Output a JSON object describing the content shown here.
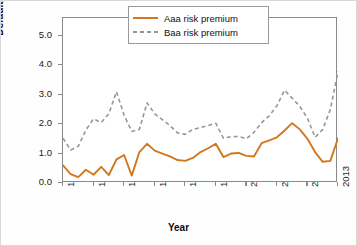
{
  "chart_data": {
    "type": "line",
    "title": "",
    "xlabel": "Year",
    "ylabel": "Default Premium (%)",
    "xlim": [
      1977,
      2013
    ],
    "ylim": [
      0.0,
      5.6
    ],
    "grid": false,
    "legend_position": "top-right-inside",
    "xticks": [
      "1977",
      "1981",
      "1985",
      "1989",
      "1993",
      "1997",
      "2001",
      "2005",
      "2009",
      "2013"
    ],
    "xtick_values": [
      1977,
      1981,
      1985,
      1989,
      1993,
      1997,
      2001,
      2005,
      2009,
      2013
    ],
    "yticks": [
      "0.0",
      "1.0",
      "2.0",
      "3.0",
      "4.0",
      "5.0"
    ],
    "ytick_values": [
      0.0,
      1.0,
      2.0,
      3.0,
      4.0,
      5.0
    ],
    "x": [
      1977,
      1978,
      1979,
      1980,
      1981,
      1982,
      1983,
      1984,
      1985,
      1986,
      1987,
      1988,
      1989,
      1990,
      1991,
      1992,
      1993,
      1994,
      1995,
      1996,
      1997,
      1998,
      1999,
      2000,
      2001,
      2002,
      2003,
      2004,
      2005,
      2006,
      2007,
      2008,
      2009,
      2010,
      2011,
      2012,
      2013
    ],
    "series": [
      {
        "name": "Aaa risk premium",
        "style": "solid",
        "color": "#D2771F",
        "values": [
          0.6,
          0.3,
          0.2,
          0.45,
          0.28,
          0.55,
          0.27,
          0.8,
          0.95,
          0.25,
          1.05,
          1.33,
          1.1,
          1.0,
          0.9,
          0.78,
          0.75,
          0.85,
          1.05,
          1.18,
          1.33,
          0.88,
          1.0,
          1.02,
          0.92,
          0.9,
          1.35,
          1.45,
          1.55,
          1.78,
          2.03,
          1.82,
          1.5,
          1.05,
          0.72,
          0.75,
          1.52
        ]
      },
      {
        "name": "Baa risk premium",
        "style": "dashed",
        "color": "#8C9C94",
        "values": [
          1.52,
          1.12,
          1.25,
          1.8,
          2.18,
          2.05,
          2.35,
          3.1,
          2.3,
          1.75,
          1.82,
          2.72,
          2.35,
          2.15,
          1.95,
          1.7,
          1.65,
          1.82,
          1.88,
          1.95,
          2.03,
          1.52,
          1.57,
          1.58,
          1.5,
          1.72,
          2.05,
          2.28,
          2.62,
          3.15,
          2.88,
          2.6,
          2.2,
          1.55,
          1.82,
          2.5,
          3.78
        ]
      }
    ],
    "series_extended": {
      "note": "values continue through 2013",
      "aaa_tail": [
        1.95,
        2.0,
        1.65,
        1.72,
        1.8,
        1.88
      ],
      "baa_tail": [
        4.0,
        3.3,
        2.72,
        2.78,
        3.05,
        2.8
      ]
    }
  },
  "axis": {
    "y_title": "Default Premium (%)",
    "x_title": "Year"
  },
  "legend": {
    "items": [
      {
        "label": "Aaa risk premium",
        "style": "solid",
        "color": "#D2771F"
      },
      {
        "label": "Baa risk premium",
        "style": "dashed",
        "color": "#8C9C94"
      }
    ]
  },
  "colors": {
    "aaa": "#D2771F",
    "baa": "#8C9C94",
    "frame": "#8a8a8a",
    "text": "#111111",
    "background": "#ffffff"
  }
}
